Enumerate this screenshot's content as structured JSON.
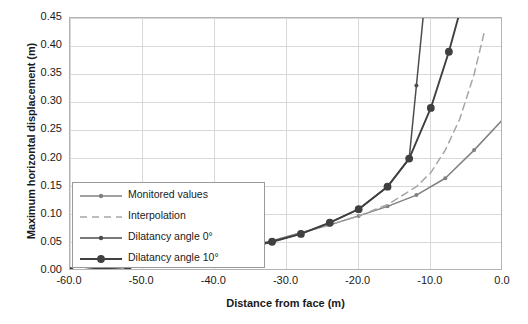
{
  "chart_data": {
    "type": "line",
    "title": "",
    "xlabel": "Distance from face (m)",
    "ylabel": "Maximum horizontal displacement (m)",
    "xlim": [
      -60.0,
      0.0
    ],
    "ylim": [
      0.45,
      0.0
    ],
    "y_inverted": true,
    "grid": true,
    "legend_position": "lower-left-inside",
    "xticks": [
      "-60.0",
      "-50.0",
      "-40.0",
      "-30.0",
      "-20.0",
      "-10.0",
      "0.0"
    ],
    "xtick_values": [
      -60,
      -50,
      -40,
      -30,
      -20,
      -10,
      0
    ],
    "yticks": [
      "0.00",
      "0.05",
      "0.10",
      "0.15",
      "0.20",
      "0.25",
      "0.30",
      "0.35",
      "0.40",
      "0.45"
    ],
    "ytick_values": [
      0.0,
      0.05,
      0.1,
      0.15,
      0.2,
      0.25,
      0.3,
      0.35,
      0.4,
      0.45
    ],
    "series": [
      {
        "name": "Monitored values",
        "color": "#808080",
        "style": "solid",
        "marker": "small-circle",
        "x": [
          -60,
          -56,
          -52,
          -48,
          -44,
          -40,
          -36,
          -32,
          -28,
          -24,
          -20,
          -16,
          -12,
          -8,
          -4,
          0
        ],
        "values": [
          0.0,
          0.003,
          0.006,
          0.012,
          0.021,
          0.031,
          0.042,
          0.054,
          0.068,
          0.082,
          0.098,
          0.115,
          0.135,
          0.165,
          0.215,
          0.27
        ]
      },
      {
        "name": "Interpolation",
        "color": "#a6a6a6",
        "style": "dashed",
        "marker": "none",
        "x": [
          -28,
          -24,
          -20,
          -16,
          -12,
          -10,
          -8,
          -6,
          -4,
          -2.5
        ],
        "values": [
          0.068,
          0.082,
          0.098,
          0.118,
          0.15,
          0.175,
          0.215,
          0.27,
          0.35,
          0.43
        ]
      },
      {
        "name": "Dilatancy angle 0°",
        "color": "#4d4d4d",
        "style": "solid",
        "marker": "small-circle",
        "x": [
          -60,
          -56,
          -52,
          -48,
          -44,
          -40,
          -36,
          -32,
          -28,
          -24,
          -20,
          -16,
          -13,
          -12,
          -11
        ],
        "values": [
          0.0,
          0.004,
          0.008,
          0.014,
          0.022,
          0.03,
          0.04,
          0.052,
          0.066,
          0.086,
          0.11,
          0.15,
          0.2,
          0.33,
          0.46
        ]
      },
      {
        "name": "Dilatancy angle 10°",
        "color": "#404040",
        "style": "solid",
        "marker": "large-circle",
        "x": [
          -60,
          -56,
          -52,
          -48,
          -44,
          -40,
          -36,
          -32,
          -28,
          -24,
          -20,
          -16,
          -13,
          -10,
          -7.5,
          -6
        ],
        "values": [
          0.0,
          0.004,
          0.008,
          0.014,
          0.022,
          0.03,
          0.04,
          0.052,
          0.066,
          0.086,
          0.11,
          0.15,
          0.2,
          0.29,
          0.39,
          0.46
        ]
      }
    ],
    "legend": [
      {
        "label": "Monitored values",
        "color": "#808080",
        "style": "solid",
        "marker": "small-circle"
      },
      {
        "label": "Interpolation",
        "color": "#a6a6a6",
        "style": "dashed",
        "marker": "none"
      },
      {
        "label": "Dilatancy angle 0°",
        "color": "#4d4d4d",
        "style": "solid",
        "marker": "small-circle"
      },
      {
        "label": "Dilatancy angle 10°",
        "color": "#404040",
        "style": "solid",
        "marker": "large-circle"
      }
    ],
    "colors": {
      "grid": "#d9d9d9",
      "frame": "#b3b3b3",
      "text": "#1a1a1a",
      "background": "#ffffff",
      "legend_border": "#9a9a9a"
    }
  }
}
